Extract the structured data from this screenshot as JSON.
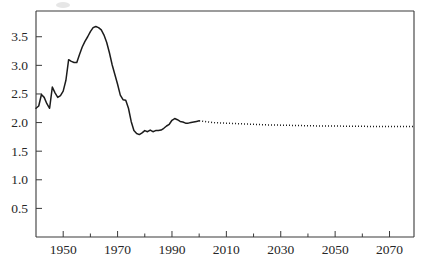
{
  "chart_data": {
    "type": "line",
    "title": "",
    "xlabel": "",
    "ylabel": "",
    "xlim": [
      1940,
      2079
    ],
    "ylim": [
      0,
      3.95
    ],
    "grid": false,
    "legend": null,
    "ytick_labels": [
      "0.5",
      "1.0",
      "1.5",
      "2.0",
      "2.5",
      "3.0",
      "3.5"
    ],
    "ytick_values": [
      0.5,
      1.0,
      1.5,
      2.0,
      2.5,
      3.0,
      3.5
    ],
    "xtick_labels": [
      "1950",
      "1970",
      "1990",
      "2010",
      "2030",
      "2050",
      "2070"
    ],
    "xtick_values": [
      1950,
      1970,
      1990,
      2010,
      2030,
      2050,
      2070
    ],
    "xminor_values": [
      1940,
      1960,
      1980,
      2000,
      2020,
      2040,
      2060
    ],
    "series": [
      {
        "name": "observed",
        "style": "solid",
        "x": [
          1940,
          1941,
          1942,
          1943,
          1944,
          1945,
          1946,
          1947,
          1948,
          1949,
          1950,
          1951,
          1952,
          1953,
          1954,
          1955,
          1956,
          1957,
          1958,
          1959,
          1960,
          1961,
          1962,
          1963,
          1964,
          1965,
          1966,
          1967,
          1968,
          1969,
          1970,
          1971,
          1972,
          1973,
          1974,
          1975,
          1976,
          1977,
          1978,
          1979,
          1980,
          1981,
          1982,
          1983,
          1984,
          1985,
          1986,
          1987,
          1988,
          1989,
          1990,
          1991,
          1992,
          1993,
          1994,
          1995,
          1996,
          1997,
          1998,
          1999,
          2000
        ],
        "y": [
          2.25,
          2.29,
          2.49,
          2.44,
          2.33,
          2.25,
          2.62,
          2.52,
          2.44,
          2.47,
          2.55,
          2.74,
          3.1,
          3.07,
          3.05,
          3.05,
          3.19,
          3.32,
          3.42,
          3.5,
          3.59,
          3.66,
          3.68,
          3.66,
          3.62,
          3.53,
          3.4,
          3.22,
          3.01,
          2.84,
          2.67,
          2.48,
          2.4,
          2.39,
          2.25,
          2.02,
          1.86,
          1.81,
          1.79,
          1.82,
          1.86,
          1.84,
          1.87,
          1.84,
          1.86,
          1.86,
          1.87,
          1.9,
          1.94,
          1.97,
          2.04,
          2.07,
          2.05,
          2.02,
          2.01,
          1.99,
          1.99,
          2.0,
          2.01,
          2.02,
          2.03
        ]
      },
      {
        "name": "projected",
        "style": "dotted",
        "x": [
          2000,
          2005,
          2010,
          2015,
          2020,
          2025,
          2030,
          2035,
          2040,
          2045,
          2050,
          2055,
          2060,
          2065,
          2070,
          2075,
          2079
        ],
        "y": [
          2.03,
          2.0,
          1.99,
          1.98,
          1.97,
          1.96,
          1.955,
          1.95,
          1.945,
          1.94,
          1.94,
          1.935,
          1.935,
          1.93,
          1.93,
          1.93,
          1.93
        ]
      }
    ]
  },
  "axes": {
    "plot_left_px": 36,
    "plot_right_px": 414,
    "plot_top_px": 11,
    "plot_bottom_px": 237
  }
}
